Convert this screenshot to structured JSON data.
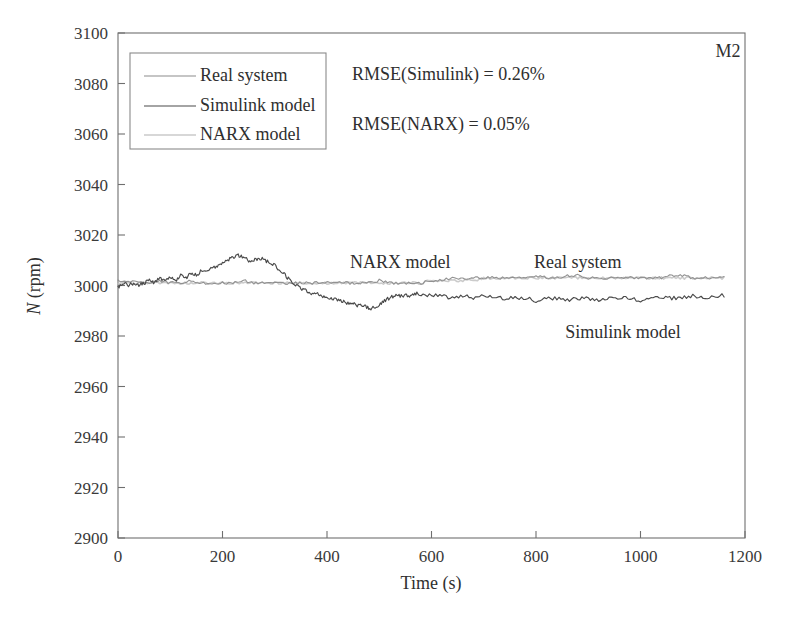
{
  "figure": {
    "corner_label": "M2",
    "background_color": "#ffffff"
  },
  "annotations": {
    "narx": "NARX model",
    "real": "Real system",
    "simulink": "Simulink model",
    "rmse_simulink": "RMSE(Simulink) = 0.26%",
    "rmse_narx": "RMSE(NARX) = 0.05%"
  },
  "legend": {
    "items": [
      {
        "label": "Real system",
        "color": "#8c8c8c"
      },
      {
        "label": "Simulink model",
        "color": "#4a4a4a"
      },
      {
        "label": "NARX model",
        "color": "#c9c9c9"
      }
    ]
  },
  "axes": {
    "x_title": "Time (s)",
    "y_title_symbol": "N",
    "y_title_unit": " (rpm)",
    "x_ticks": [
      "0",
      "200",
      "400",
      "600",
      "800",
      "1000",
      "1200"
    ],
    "y_ticks": [
      "3100",
      "3080",
      "3060",
      "3040",
      "3020",
      "3000",
      "2980",
      "2960",
      "2940",
      "2920",
      "2900"
    ]
  },
  "chart_data": {
    "type": "line",
    "title": "",
    "xlabel": "Time (s)",
    "ylabel": "N (rpm)",
    "xlim": [
      0,
      1200
    ],
    "ylim": [
      2900,
      3100
    ],
    "xticks": [
      0,
      200,
      400,
      600,
      800,
      1000,
      1200
    ],
    "yticks": [
      2900,
      2920,
      2940,
      2960,
      2980,
      3000,
      3020,
      3040,
      3060,
      3080,
      3100
    ],
    "grid": false,
    "legend_position": "upper-left",
    "annotations": [
      {
        "text": "NARX model",
        "x": 430,
        "y": 3018
      },
      {
        "text": "Real system",
        "x": 790,
        "y": 3018
      },
      {
        "text": "Simulink model",
        "x": 950,
        "y": 2985
      },
      {
        "text": "RMSE(Simulink) = 0.26%",
        "x": 540,
        "y": 3082
      },
      {
        "text": "RMSE(NARX) = 0.05%",
        "x": 540,
        "y": 3062
      },
      {
        "text": "M2",
        "x": 1160,
        "y": 3093
      }
    ],
    "series": [
      {
        "name": "Real system",
        "color": "#8c8c8c",
        "x": [
          0,
          20,
          40,
          60,
          80,
          100,
          120,
          140,
          160,
          180,
          200,
          220,
          240,
          260,
          280,
          300,
          320,
          340,
          360,
          380,
          400,
          420,
          440,
          460,
          480,
          500,
          520,
          540,
          560,
          580,
          600,
          620,
          640,
          660,
          680,
          700,
          720,
          740,
          760,
          780,
          800,
          820,
          840,
          860,
          880,
          900,
          920,
          940,
          960,
          980,
          1000,
          1020,
          1040,
          1060,
          1080,
          1100,
          1120,
          1140,
          1160
        ],
        "y": [
          3002,
          3002,
          3001,
          3001,
          3002,
          3001,
          3001,
          3002,
          3001,
          3001,
          3001,
          3001,
          3002,
          3001,
          3001,
          3001,
          3001,
          3001,
          3001,
          3001,
          3001,
          3001,
          3001,
          3001,
          3001,
          3002,
          3001,
          3001,
          3001,
          3001,
          3002,
          3002,
          3003,
          3003,
          3003,
          3003,
          3003,
          3003,
          3003,
          3003,
          3004,
          3003,
          3003,
          3004,
          3004,
          3003,
          3003,
          3003,
          3003,
          3003,
          3003,
          3003,
          3003,
          3004,
          3004,
          3003,
          3003,
          3003,
          3003
        ]
      },
      {
        "name": "Simulink model",
        "color": "#4a4a4a",
        "x": [
          0,
          10,
          20,
          30,
          40,
          50,
          60,
          70,
          80,
          90,
          100,
          110,
          120,
          130,
          140,
          150,
          160,
          170,
          180,
          190,
          200,
          210,
          220,
          230,
          240,
          250,
          260,
          270,
          280,
          290,
          300,
          310,
          320,
          330,
          340,
          350,
          360,
          370,
          380,
          390,
          400,
          410,
          420,
          430,
          440,
          450,
          460,
          470,
          480,
          490,
          500,
          510,
          520,
          530,
          540,
          550,
          560,
          570,
          580,
          600,
          620,
          640,
          660,
          680,
          700,
          720,
          740,
          760,
          780,
          800,
          820,
          840,
          860,
          880,
          900,
          920,
          940,
          960,
          980,
          1000,
          1020,
          1040,
          1060,
          1080,
          1100,
          1120,
          1140,
          1160
        ],
        "y": [
          2999,
          3001,
          3000,
          3001,
          3000,
          3001,
          3002,
          3001,
          3003,
          3002,
          3003,
          3002,
          3004,
          3003,
          3005,
          3004,
          3006,
          3006,
          3007,
          3008,
          3009,
          3010,
          3011,
          3012,
          3011,
          3010,
          3010,
          3011,
          3010,
          3009,
          3008,
          3006,
          3004,
          3002,
          3000,
          2999,
          2998,
          2997,
          2997,
          2996,
          2995,
          2995,
          2994,
          2994,
          2993,
          2993,
          2992,
          2992,
          2991,
          2991,
          2992,
          2994,
          2995,
          2996,
          2996,
          2996,
          2996,
          2997,
          2996,
          2996,
          2996,
          2995,
          2996,
          2995,
          2996,
          2995,
          2995,
          2995,
          2995,
          2994,
          2995,
          2995,
          2994,
          2995,
          2995,
          2994,
          2995,
          2995,
          2995,
          2994,
          2995,
          2995,
          2995,
          2995,
          2996,
          2995,
          2996,
          2996
        ]
      },
      {
        "name": "NARX model",
        "color": "#c2c2c2",
        "x": [
          0,
          20,
          40,
          60,
          80,
          100,
          120,
          140,
          160,
          180,
          200,
          220,
          240,
          260,
          280,
          300,
          320,
          340,
          360,
          380,
          400,
          420,
          440,
          460,
          480,
          500,
          520,
          540,
          560,
          580,
          600,
          620,
          640,
          660,
          680,
          700,
          720,
          740,
          760,
          780,
          800,
          820,
          840,
          860,
          880,
          900,
          920,
          940,
          960,
          980,
          1000,
          1020,
          1040,
          1060,
          1080,
          1100,
          1120,
          1140,
          1160
        ],
        "y": [
          3001,
          3001,
          3001,
          3001,
          3001,
          3001,
          3001,
          3001,
          3001,
          3001,
          3001,
          3001,
          3001,
          3001,
          3001,
          3001,
          3001,
          3001,
          3001,
          3001,
          3001,
          3001,
          3001,
          3001,
          3001,
          3001,
          3001,
          3001,
          3001,
          3001,
          3002,
          3002,
          3002,
          3002,
          3002,
          3003,
          3003,
          3003,
          3003,
          3003,
          3003,
          3003,
          3003,
          3003,
          3003,
          3003,
          3003,
          3003,
          3003,
          3003,
          3003,
          3003,
          3003,
          3003,
          3003,
          3003,
          3003,
          3003,
          3003
        ]
      }
    ]
  }
}
